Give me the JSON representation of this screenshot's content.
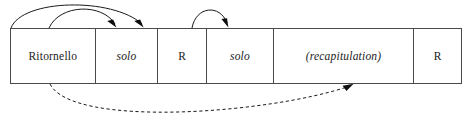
{
  "diagram": {
    "line_color": "#4a4a4a",
    "text_color": "#1a1a1a",
    "arrow_color": "#0d0d0d",
    "background": "#ffffff",
    "sections": [
      {
        "label": "Ritornello",
        "style": "roman",
        "width_px": 85
      },
      {
        "label": "solo",
        "style": "italic",
        "width_px": 63
      },
      {
        "label": "R",
        "style": "roman",
        "width_px": 49
      },
      {
        "label": "solo",
        "style": "italic",
        "width_px": 67
      },
      {
        "label": "(recapitulation)",
        "style": "italic",
        "width_px": 141
      },
      {
        "label": "R",
        "style": "roman",
        "width_px": 47
      }
    ],
    "connectors": [
      {
        "name": "ritornello-to-R1-outer",
        "kind": "solid",
        "from": "Ritornello",
        "to": "R",
        "position": "above"
      },
      {
        "name": "ritornello-to-solo2",
        "kind": "solid",
        "from": "Ritornello",
        "to": "solo",
        "position": "above"
      },
      {
        "name": "R1-to-solo2",
        "kind": "solid",
        "from": "R",
        "to": "solo",
        "position": "above"
      },
      {
        "name": "ritornello-to-recap",
        "kind": "dashed",
        "from": "Ritornello",
        "to": "(recapitulation)",
        "position": "below"
      }
    ]
  }
}
